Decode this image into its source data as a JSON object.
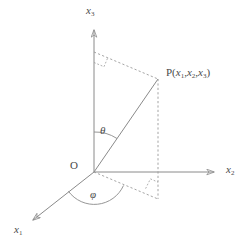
{
  "figure": {
    "type": "3d-spherical-coordinate-diagram",
    "width": 251,
    "height": 248,
    "background_color": "#ffffff",
    "line_color": "#8a8a8a",
    "text_color": "#4a4a4a",
    "solid_line_width": 1,
    "dashed_line_width": 1,
    "dash_pattern": "2,2"
  },
  "axes": [
    {
      "id": "x3",
      "name": "vertical-axis",
      "label_text": "x",
      "label_sub": "3",
      "label_full": "x₃",
      "label_x": 88,
      "label_y": 10,
      "origin": {
        "x": 94,
        "y": 172
      },
      "tip": {
        "x": 94,
        "y": 28
      },
      "arrow": true,
      "style": "solid"
    },
    {
      "id": "x2",
      "name": "right-axis",
      "label_text": "x",
      "label_sub": "2",
      "label_full": "x₂",
      "label_x": 228,
      "label_y": 167,
      "origin": {
        "x": 94,
        "y": 172
      },
      "tip": {
        "x": 216,
        "y": 172
      },
      "arrow": true,
      "style": "solid"
    },
    {
      "id": "x1",
      "name": "front-left-axis",
      "label_text": "x",
      "label_sub": "1",
      "label_full": "x₁",
      "label_x": 16,
      "label_y": 228,
      "origin": {
        "x": 94,
        "y": 172
      },
      "tip": {
        "x": 31,
        "y": 221
      },
      "arrow": true,
      "style": "solid"
    }
  ],
  "points": {
    "origin": {
      "name": "origin",
      "label": "O",
      "x": 94,
      "y": 172,
      "label_x": 72,
      "label_y": 164
    },
    "p": {
      "name": "point-p",
      "label_prefix": "P(",
      "label_full": "P(x₁,x₂,x₃)",
      "coords": [
        "x₁",
        "x₂",
        "x₃"
      ],
      "coord_subs": [
        "1",
        "2",
        "3"
      ],
      "label_suffix": ")",
      "x": 158,
      "y": 79,
      "label_x": 168,
      "label_y": 71
    },
    "projection_xy": {
      "name": "projection-on-x1x2-plane",
      "x": 158,
      "y": 199
    },
    "foot_on_x3": {
      "name": "foot-on-x3-axis",
      "x": 94,
      "y": 52
    }
  },
  "segments": [
    {
      "name": "radius-op",
      "from": {
        "x": 94,
        "y": 172
      },
      "to": {
        "x": 158,
        "y": 79
      },
      "style": "solid",
      "description": "radial line from origin O to point P"
    },
    {
      "name": "dashed-x3-to-p",
      "from": {
        "x": 94,
        "y": 52
      },
      "to": {
        "x": 158,
        "y": 79
      },
      "style": "dashed",
      "description": "horizontal projection line from x3 axis to P"
    },
    {
      "name": "dashed-p-to-plane",
      "from": {
        "x": 158,
        "y": 79
      },
      "to": {
        "x": 158,
        "y": 199
      },
      "style": "dashed",
      "description": "vertical drop from P to the x1-x2 plane"
    },
    {
      "name": "dashed-origin-to-projection",
      "from": {
        "x": 94,
        "y": 172
      },
      "to": {
        "x": 158,
        "y": 199
      },
      "style": "dashed",
      "description": "in-plane projection of the radius"
    }
  ],
  "angles": [
    {
      "name": "theta-angle",
      "symbol": "θ",
      "label_x": 101,
      "label_y": 131,
      "description": "polar angle between x3 axis and OP",
      "arc_center": {
        "x": 94,
        "y": 172
      },
      "arc_radius": 40,
      "from_deg": 270,
      "to_deg": 304.5
    },
    {
      "name": "phi-angle",
      "symbol": "φ",
      "label_x": 94,
      "label_y": 194,
      "description": "azimuthal angle from x1 axis to in-plane projection",
      "arc_center": {
        "x": 94,
        "y": 172
      },
      "arc_radius": 32,
      "from_deg": 22.9,
      "to_deg": 143.1
    }
  ],
  "right_angle_markers": [
    {
      "name": "right-angle-marker-upper",
      "vertex": {
        "x": 98,
        "y": 62
      },
      "description": "right angle at x3 axis between axis and dashed line to P"
    },
    {
      "name": "right-angle-marker-lower",
      "vertex": {
        "x": 152,
        "y": 192
      },
      "description": "right angle in x1-x2 plane at projection point"
    }
  ]
}
